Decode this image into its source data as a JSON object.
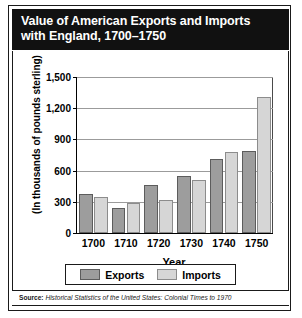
{
  "figure": {
    "title_line1": "Value of American Exports and Imports",
    "title_line2": "with England, 1700–1750",
    "source_prefix": "Source:",
    "source_text": " Historical Statistics of the United States: Colonial Times to 1970"
  },
  "colors": {
    "title_bg": "#111111",
    "title_fg": "#ffffff",
    "exports_fill": "#9d9d9d",
    "exports_border": "#5c5c5c",
    "imports_fill": "#d6d6d6",
    "imports_border": "#8c8c8c",
    "gridline": "#9b9b9b",
    "axis": "#000000",
    "frame": "#1a1a1a"
  },
  "chart_data": {
    "type": "bar",
    "title": "Value of American Exports and Imports with England, 1700–1750",
    "xlabel": "Year",
    "ylabel": "(In thousands of pounds sterling)",
    "categories": [
      "1700",
      "1710",
      "1720",
      "1730",
      "1740",
      "1750"
    ],
    "series": [
      {
        "name": "Exports",
        "values": [
          375,
          240,
          460,
          550,
          710,
          790
        ]
      },
      {
        "name": "Imports",
        "values": [
          345,
          285,
          320,
          510,
          780,
          1310
        ]
      }
    ],
    "ylim": [
      0,
      1500
    ],
    "yticks": [
      0,
      300,
      600,
      900,
      1200,
      1500
    ],
    "ytick_labels": [
      "0",
      "300",
      "600",
      "900",
      "1,200",
      "1,500"
    ],
    "grid": true,
    "legend_position": "bottom",
    "legend_entries": [
      "Exports",
      "Imports"
    ]
  }
}
